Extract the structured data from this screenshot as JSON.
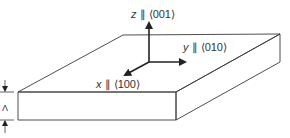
{
  "diagram": {
    "type": "crystal-slab-axes",
    "axes": {
      "z": {
        "var": "z",
        "sep": " ∥ ",
        "dir": "⟨001⟩"
      },
      "y": {
        "var": "y",
        "sep": " ∥ ",
        "dir": "⟨010⟩"
      },
      "x": {
        "var": "x",
        "sep": " ∥ ",
        "dir": "⟨100⟩"
      }
    },
    "thickness_label": "Λ",
    "colors": {
      "line": "#3a3a3a",
      "arrow": "#222222",
      "text": "#333333",
      "background": "#ffffff"
    }
  }
}
